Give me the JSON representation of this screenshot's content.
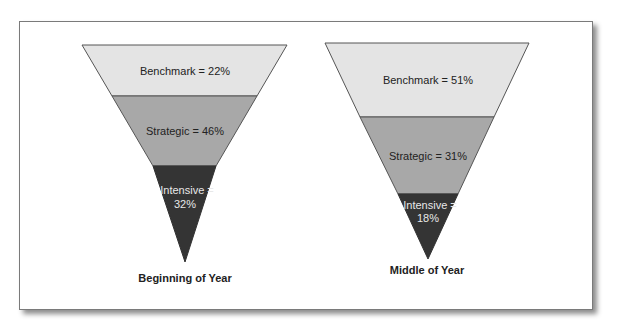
{
  "colors": {
    "benchmark": "#e4e4e4",
    "strategic": "#a8a8a8",
    "intensive": "#343434",
    "label_dark": "#222222",
    "label_light": "#e8e8e8"
  },
  "funnels": [
    {
      "caption": "Beginning of Year",
      "segments": [
        {
          "name": "Benchmark",
          "value": 22,
          "label": "Benchmark = 22%"
        },
        {
          "name": "Strategic",
          "value": 46,
          "label": "Strategic = 46%"
        },
        {
          "name": "Intensive",
          "value": 32,
          "label_line1": "Intensive =",
          "label_line2": "32%"
        }
      ]
    },
    {
      "caption": "Middle of Year",
      "segments": [
        {
          "name": "Benchmark",
          "value": 51,
          "label": "Benchmark = 51%"
        },
        {
          "name": "Strategic",
          "value": 31,
          "label": "Strategic = 31%"
        },
        {
          "name": "Intensive",
          "value": 18,
          "label_line1": "Intensive =",
          "label_line2": "18%"
        }
      ]
    }
  ]
}
